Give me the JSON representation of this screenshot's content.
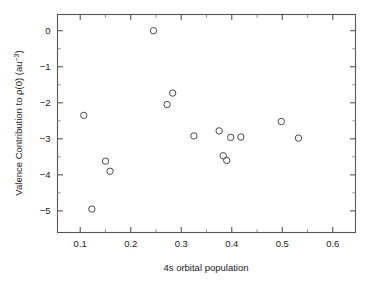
{
  "chart_data": {
    "type": "scatter",
    "title": "",
    "xlabel": "4s orbital population",
    "ylabel": "Valence Contribution to ρ(0) (au⁻³)",
    "ylabel_parts": {
      "prefix": "Valence Contribution to ",
      "rho": "ρ(0)",
      "unit_open": " (au",
      "unit_exp": "−3",
      "unit_close": ")"
    },
    "xlim": [
      0.055,
      0.645
    ],
    "ylim": [
      -5.6,
      0.45
    ],
    "grid": false,
    "legend": null,
    "xticks": [
      0.1,
      0.2,
      0.3,
      0.4,
      0.5,
      0.6
    ],
    "xticklabels": [
      "0.1",
      "0.2",
      "0.3",
      "0.4",
      "0.5",
      "0.6"
    ],
    "xminorticks": [
      0.15,
      0.25,
      0.35,
      0.45,
      0.55
    ],
    "yticks": [
      0,
      -1,
      -2,
      -3,
      -4,
      -5
    ],
    "yticklabels": [
      "0",
      "−1",
      "−2",
      "−3",
      "−4",
      "−5"
    ],
    "yminorticks": [
      -0.5,
      -1.5,
      -2.5,
      -3.5,
      -4.5
    ],
    "marker": {
      "shape": "circle-open",
      "radius_px": 3.2,
      "edge_color": "#4a4a4a",
      "face_color": "none",
      "line_width": 1.0
    },
    "x": [
      0.245,
      0.107,
      0.15,
      0.159,
      0.123,
      0.272,
      0.283,
      0.325,
      0.375,
      0.398,
      0.418,
      0.383,
      0.39,
      0.498,
      0.532
    ],
    "y": [
      0.0,
      -2.35,
      -3.62,
      -3.9,
      -4.95,
      -2.05,
      -1.73,
      -2.92,
      -2.78,
      -2.96,
      -2.95,
      -3.47,
      -3.6,
      -2.52,
      -2.98
    ],
    "points": [
      {
        "x": 0.245,
        "y": 0.0
      },
      {
        "x": 0.107,
        "y": -2.35
      },
      {
        "x": 0.15,
        "y": -3.62
      },
      {
        "x": 0.159,
        "y": -3.9
      },
      {
        "x": 0.123,
        "y": -4.95
      },
      {
        "x": 0.272,
        "y": -2.05
      },
      {
        "x": 0.283,
        "y": -1.73
      },
      {
        "x": 0.325,
        "y": -2.92
      },
      {
        "x": 0.375,
        "y": -2.78
      },
      {
        "x": 0.398,
        "y": -2.96
      },
      {
        "x": 0.418,
        "y": -2.95
      },
      {
        "x": 0.383,
        "y": -3.47
      },
      {
        "x": 0.39,
        "y": -3.6
      },
      {
        "x": 0.498,
        "y": -2.52
      },
      {
        "x": 0.532,
        "y": -2.98
      }
    ],
    "n_points": 15
  },
  "figure": {
    "background_color": "#ffffff",
    "axis_color": "#555555",
    "text_color": "#1a1a1a"
  }
}
